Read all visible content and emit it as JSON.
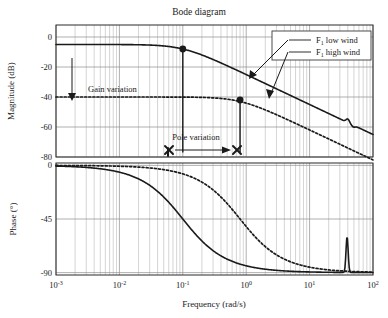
{
  "figure": {
    "title": "Bode diagram",
    "xlabel": "Frequency (rad/s)",
    "ylabel_magnitude": "Magnitude (dB)",
    "ylabel_phase": "Phase (°)"
  },
  "legend": {
    "entries": [
      {
        "label_prefix": "F",
        "label_sub": "1",
        "label_rest": " low wind",
        "style": "solid"
      },
      {
        "label_prefix": "F",
        "label_sub": "1",
        "label_rest": " high wind",
        "style": "dotted"
      }
    ]
  },
  "annotations": [
    {
      "id": "gain-variation",
      "text": "Gain variation",
      "x": 88,
      "y": 92
    },
    {
      "id": "pole-variation",
      "text": "Pole variation",
      "x": 196,
      "y": 140
    }
  ],
  "ticks": {
    "x_mantissa": "10",
    "x_exponents": [
      "-3",
      "-2",
      "-1",
      "0",
      "1",
      "2"
    ],
    "y_magnitude": [
      "0",
      "-20",
      "-40",
      "-60",
      "-80"
    ],
    "y_phase": [
      "0",
      "-45",
      "-90"
    ]
  },
  "chart_data": {
    "type": "line",
    "title": "Bode diagram",
    "xlabel": "Frequency (rad/s)",
    "xscale": "log",
    "xlim": [
      0.001,
      100
    ],
    "xticks": [
      0.001,
      0.01,
      0.1,
      1,
      10,
      100
    ],
    "grid": true,
    "legend_position": "top-right",
    "panels": [
      {
        "name": "magnitude",
        "ylabel": "Magnitude (dB)",
        "ylim": [
          -80,
          8
        ],
        "yticks": [
          0,
          -20,
          -40,
          -60,
          -80
        ],
        "series": [
          {
            "name": "F1 low wind",
            "style": "solid",
            "gain_db": -5,
            "corner_rad_s": 0.1,
            "x": [
              0.001,
              0.002,
              0.005,
              0.01,
              0.02,
              0.05,
              0.08,
              0.1,
              0.15,
              0.2,
              0.3,
              0.5,
              0.8,
              1,
              2,
              5,
              10,
              20,
              35,
              40,
              45,
              60,
              100
            ],
            "y": [
              -5.0,
              -5.0,
              -5.0,
              -5.0,
              -5.1,
              -6.0,
              -7.2,
              -8.0,
              -10.2,
              -12.2,
              -15.5,
              -20.1,
              -24.1,
              -26.0,
              -31.1,
              -39.0,
              -45.0,
              -51.1,
              -55.5,
              -54.8,
              -57.2,
              -60.1,
              -65.0
            ],
            "markers": [
              {
                "x": 0.1,
                "y": -8.0
              }
            ],
            "notch_rad_s": 40
          },
          {
            "name": "F1 high wind",
            "style": "dotted",
            "gain_db": -40,
            "corner_rad_s": 0.8,
            "x": [
              0.001,
              0.01,
              0.05,
              0.1,
              0.2,
              0.4,
              0.6,
              0.8,
              1,
              2,
              3,
              5,
              10,
              20,
              50,
              100
            ],
            "y": [
              -40.0,
              -40.0,
              -40.0,
              -40.1,
              -40.3,
              -41.0,
              -41.9,
              -43.0,
              -44.1,
              -48.9,
              -52.1,
              -56.3,
              -62.0,
              -68.0,
              -76.0,
              -82.0
            ],
            "markers": [
              {
                "x": 0.8,
                "y": -42.0
              }
            ]
          }
        ],
        "gain_variation": {
          "label": "Gain variation",
          "arrow_x_rad_s": 0.0033,
          "arrow_from_db": -5,
          "arrow_to_db": -40
        },
        "pole_variation": {
          "label": "Pole variation",
          "marker": "x",
          "from_rad_s": 0.1,
          "to_rad_s": 0.8,
          "y_db": -77
        }
      },
      {
        "name": "phase",
        "ylabel": "Phase (°)",
        "ylim": [
          -92,
          2
        ],
        "yticks": [
          0,
          -45,
          -90
        ],
        "series": [
          {
            "name": "F1 low wind",
            "style": "solid",
            "corner_rad_s": 0.1,
            "x": [
              0.001,
              0.005,
              0.01,
              0.02,
              0.03,
              0.05,
              0.07,
              0.1,
              0.15,
              0.2,
              0.3,
              0.5,
              1,
              2,
              5,
              10,
              20,
              35,
              38,
              40,
              43,
              60,
              100
            ],
            "y": [
              -0.6,
              -2.9,
              -5.7,
              -11.3,
              -16.7,
              -26.6,
              -35.0,
              -45.0,
              -56.3,
              -63.4,
              -71.6,
              -78.7,
              -84.3,
              -87.1,
              -88.9,
              -89.4,
              -89.7,
              -89.8,
              -70.0,
              -62.0,
              -86.0,
              -89.6,
              -89.8
            ],
            "resonance_peak_rad_s": 39
          },
          {
            "name": "F1 high wind",
            "style": "dotted",
            "corner_rad_s": 0.8,
            "x": [
              0.001,
              0.01,
              0.05,
              0.1,
              0.2,
              0.3,
              0.5,
              0.8,
              1,
              1.5,
              2,
              3,
              5,
              8,
              15,
              30,
              60,
              100
            ],
            "y": [
              -0.07,
              -0.7,
              -3.6,
              -7.1,
              -14.0,
              -20.6,
              -32.0,
              -45.0,
              -51.3,
              -61.9,
              -68.2,
              -75.1,
              -80.9,
              -84.3,
              -87.0,
              -88.5,
              -89.2,
              -89.5
            ]
          }
        ]
      }
    ]
  }
}
